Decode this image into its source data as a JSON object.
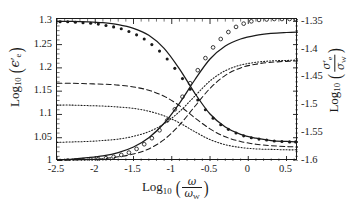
{
  "figure": {
    "background": "#ffffff",
    "frame_color": "#1a1a1a"
  },
  "axes": {
    "x": {
      "label_parts": {
        "log": "Log",
        "base": "10",
        "numer": "ω",
        "denom": "ω",
        "denom_sub": "W"
      },
      "min": -2.5,
      "max": 0.65,
      "ticks": [
        -2.5,
        -2,
        -1.5,
        -1,
        -0.5,
        0,
        0.5
      ],
      "tick_labels": [
        "-2.5",
        "-2",
        "-1.5",
        "-1",
        "-0.5",
        "0",
        "0.5"
      ],
      "minor_tick_step": 0.1
    },
    "y_left": {
      "label_parts": {
        "log": "Log",
        "base": "10",
        "sym": "ϵ",
        "prime": "′",
        "sym_sub": "e"
      },
      "min": 1.0,
      "max": 1.305,
      "ticks": [
        1,
        1.05,
        1.1,
        1.15,
        1.2,
        1.25,
        1.3
      ],
      "tick_labels": [
        "1",
        "1.05",
        "1.1",
        "1.15",
        "1.2",
        "1.25",
        "1.3"
      ],
      "minor_tick_step": 0.01
    },
    "y_right": {
      "label_parts": {
        "log": "Log",
        "base": "10",
        "numer": "σ",
        "numer_prime": "′",
        "numer_sub": "e",
        "denom": "σ",
        "denom_sub": "W"
      },
      "min": -1.6,
      "max": -1.345,
      "ticks": [
        -1.6,
        -1.55,
        -1.5,
        -1.45,
        -1.4,
        -1.35
      ],
      "tick_labels": [
        "-1.6",
        "-1.55",
        "-1.5",
        "-1.45",
        "-1.4",
        "-1.35"
      ],
      "minor_tick_step": 0.01
    }
  },
  "chart_data": {
    "type": "line",
    "title": "",
    "xlabel": "Log10( ω / ω_W )",
    "ylabel": "Log10( ϵ'_e )",
    "ylabel_right": "Log10( σ'_e / σ_W )",
    "xlim": [
      -2.5,
      0.65
    ],
    "ylim": [
      1.0,
      1.305
    ],
    "ylim_right": [
      -1.6,
      -1.345
    ],
    "grid": false,
    "legend": "none",
    "x": [
      -2.5,
      -2.3,
      -2.1,
      -1.9,
      -1.7,
      -1.5,
      -1.3,
      -1.1,
      -0.9,
      -0.7,
      -0.5,
      -0.3,
      -0.1,
      0.1,
      0.3,
      0.5,
      0.65
    ],
    "series": [
      {
        "name": "permittivity-solid",
        "axis": "left",
        "style": "solid",
        "trend": "decreasing",
        "values": [
          1.3,
          1.3,
          1.299,
          1.297,
          1.293,
          1.285,
          1.27,
          1.242,
          1.198,
          1.146,
          1.101,
          1.073,
          1.057,
          1.049,
          1.044,
          1.042,
          1.041
        ]
      },
      {
        "name": "permittivity-dashed",
        "axis": "left",
        "style": "dashed",
        "trend": "decreasing",
        "values": [
          1.167,
          1.167,
          1.166,
          1.165,
          1.163,
          1.159,
          1.152,
          1.139,
          1.119,
          1.093,
          1.069,
          1.052,
          1.042,
          1.036,
          1.033,
          1.031,
          1.03
        ]
      },
      {
        "name": "permittivity-dotted",
        "axis": "left",
        "style": "dotted",
        "trend": "decreasing",
        "values": [
          1.12,
          1.12,
          1.119,
          1.118,
          1.116,
          1.113,
          1.107,
          1.097,
          1.082,
          1.063,
          1.046,
          1.035,
          1.029,
          1.026,
          1.025,
          1.024,
          1.024
        ]
      },
      {
        "name": "conductivity-solid",
        "axis": "right",
        "style": "solid",
        "trend": "increasing",
        "values": [
          1.002,
          1.004,
          1.007,
          1.011,
          1.018,
          1.03,
          1.05,
          1.081,
          1.124,
          1.174,
          1.219,
          1.247,
          1.262,
          1.27,
          1.274,
          1.276,
          1.277
        ]
      },
      {
        "name": "conductivity-dashed",
        "axis": "right",
        "style": "dashed",
        "trend": "increasing",
        "values": [
          1.001,
          1.002,
          1.003,
          1.005,
          1.009,
          1.015,
          1.026,
          1.046,
          1.077,
          1.117,
          1.156,
          1.184,
          1.2,
          1.208,
          1.212,
          1.214,
          1.215
        ]
      },
      {
        "name": "conductivity-dotted",
        "axis": "right",
        "style": "dotted",
        "trend": "increasing",
        "values": [
          1.04,
          1.041,
          1.042,
          1.044,
          1.047,
          1.053,
          1.063,
          1.08,
          1.106,
          1.139,
          1.172,
          1.194,
          1.206,
          1.212,
          1.215,
          1.216,
          1.217
        ]
      }
    ],
    "marker_series": [
      {
        "name": "permittivity-filled-dots",
        "axis": "left",
        "marker": "filled-circle",
        "x": [
          -2.46,
          -2.36,
          -2.26,
          -2.16,
          -2.06,
          -1.96,
          -1.86,
          -1.76,
          -1.66,
          -1.56,
          -1.46,
          -1.36,
          -1.26,
          -1.16,
          -1.06,
          -0.96,
          -0.86,
          -0.76,
          -0.66,
          -0.56,
          -0.46,
          -0.36,
          -0.26,
          -0.16,
          -0.06,
          0.04,
          0.14,
          0.24,
          0.34,
          0.44,
          0.54,
          0.62
        ],
        "values": [
          1.299,
          1.299,
          1.298,
          1.297,
          1.296,
          1.294,
          1.291,
          1.288,
          1.284,
          1.278,
          1.271,
          1.262,
          1.25,
          1.236,
          1.219,
          1.199,
          1.177,
          1.154,
          1.131,
          1.11,
          1.092,
          1.078,
          1.068,
          1.06,
          1.054,
          1.05,
          1.047,
          1.045,
          1.043,
          1.042,
          1.041,
          1.041
        ]
      },
      {
        "name": "conductivity-open-circles",
        "axis": "right",
        "marker": "open-circle",
        "x": [
          -2.46,
          -2.36,
          -2.26,
          -2.16,
          -2.06,
          -1.96,
          -1.86,
          -1.76,
          -1.66,
          -1.56,
          -1.46,
          -1.36,
          -1.26,
          -1.16,
          -1.06,
          -0.96,
          -0.86,
          -0.76,
          -0.66,
          -0.56,
          -0.46,
          -0.36,
          -0.26,
          -0.16,
          -0.06,
          0.04,
          0.14,
          0.24,
          0.34,
          0.44,
          0.54,
          0.62
        ],
        "values": [
          1.0,
          1.001,
          1.001,
          1.002,
          1.003,
          1.004,
          1.006,
          1.009,
          1.013,
          1.018,
          1.026,
          1.036,
          1.049,
          1.066,
          1.087,
          1.111,
          1.138,
          1.167,
          1.195,
          1.221,
          1.244,
          1.262,
          1.277,
          1.288,
          1.295,
          1.3,
          1.303,
          1.304,
          1.305,
          1.305,
          1.305,
          1.305
        ]
      }
    ]
  }
}
